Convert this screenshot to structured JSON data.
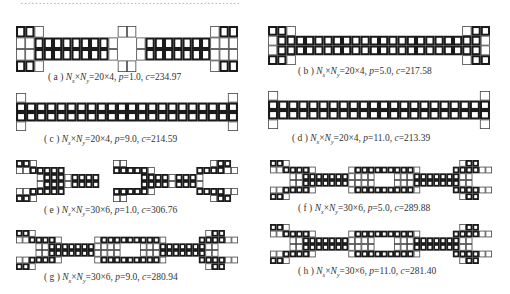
{
  "figure": {
    "top_text_fragment": "……………………………………………………",
    "panels": [
      {
        "id": "a",
        "label": "(a)",
        "nx": 20,
        "ny": 4,
        "p": "1.0",
        "c": "234.97",
        "caption_parts": {
          "open": "( a ) ",
          "nx_sym": "N",
          "nx_sub": "x",
          "times": "×",
          "ny_sym": "N",
          "ny_sub": "y",
          "eq": "=20×4, ",
          "p_sym": "p",
          "p_eq": "=1.0, ",
          "c_sym": "c",
          "c_eq": "=234.97"
        }
      },
      {
        "id": "b",
        "label": "(b)",
        "nx": 20,
        "ny": 4,
        "p": "5.0",
        "c": "217.58",
        "caption_parts": {
          "open": "( b ) ",
          "nx_sym": "N",
          "nx_sub": "x",
          "times": "×",
          "ny_sym": "N",
          "ny_sub": "y",
          "eq": "=20×4, ",
          "p_sym": "p",
          "p_eq": "=5.0, ",
          "c_sym": "c",
          "c_eq": "=217.58"
        }
      },
      {
        "id": "c",
        "label": "(c)",
        "nx": 20,
        "ny": 4,
        "p": "9.0",
        "c": "214.59",
        "caption_parts": {
          "open": "( c ) ",
          "nx_sym": "N",
          "nx_sub": "x",
          "times": "×",
          "ny_sym": "N",
          "ny_sub": "y",
          "eq": "=20×4, ",
          "p_sym": "p",
          "p_eq": "=9.0, ",
          "c_sym": "c",
          "c_eq": "=214.59"
        }
      },
      {
        "id": "d",
        "label": "(d)",
        "nx": 20,
        "ny": 4,
        "p": "11.0",
        "c": "213.39",
        "caption_parts": {
          "open": "( d ) ",
          "nx_sym": "N",
          "nx_sub": "x",
          "times": "×",
          "ny_sym": "N",
          "ny_sub": "y",
          "eq": "=20×4, ",
          "p_sym": "p",
          "p_eq": "=11.0, ",
          "c_sym": "c",
          "c_eq": "=213.39"
        }
      },
      {
        "id": "e",
        "label": "(e)",
        "nx": 30,
        "ny": 6,
        "p": "1.0",
        "c": "306.76",
        "caption_parts": {
          "open": "( e ) ",
          "nx_sym": "N",
          "nx_sub": "x",
          "times": "×",
          "ny_sym": "N",
          "ny_sub": "y",
          "eq": "=30×6, ",
          "p_sym": "p",
          "p_eq": "=1.0, ",
          "c_sym": "c",
          "c_eq": "=306.76"
        }
      },
      {
        "id": "f",
        "label": "(f)",
        "nx": 30,
        "ny": 6,
        "p": "5.0",
        "c": "289.88",
        "caption_parts": {
          "open": "( f ) ",
          "nx_sym": "N",
          "nx_sub": "x",
          "times": "×",
          "ny_sym": "N",
          "ny_sub": "y",
          "eq": "=30×6, ",
          "p_sym": "p",
          "p_eq": "=5.0, ",
          "c_sym": "c",
          "c_eq": "=289.88"
        }
      },
      {
        "id": "g",
        "label": "(g)",
        "nx": 30,
        "ny": 6,
        "p": "9.0",
        "c": "280.94",
        "caption_parts": {
          "open": "( g ) ",
          "nx_sym": "N",
          "nx_sub": "x",
          "times": "×",
          "ny_sym": "N",
          "ny_sub": "y",
          "eq": "=30×6, ",
          "p_sym": "p",
          "p_eq": "=9.0, ",
          "c_sym": "c",
          "c_eq": "=280.94"
        }
      },
      {
        "id": "h",
        "label": "(h)",
        "nx": 30,
        "ny": 6,
        "p": "11.0",
        "c": "281.40",
        "caption_parts": {
          "open": "( h ) ",
          "nx_sym": "N",
          "nx_sub": "x",
          "times": "×",
          "ny_sym": "N",
          "ny_sub": "y",
          "eq": "=30×6, ",
          "p_sym": "p",
          "p_eq": "=11.0, ",
          "c_sym": "c",
          "c_eq": "=281.40"
        }
      }
    ],
    "grids": {
      "legend": "S = solid cell (thick black frame with hole), V = void/thin cell (thin outline), . = empty",
      "a": [
        "SSV........VV........VSS",
        "VVSSSSSSSSV..VSSSSSSSVVV",
        "VVSSSSSSSSV..VSSSSSSSVVV",
        "SSV........VV........VSS"
      ],
      "b": [
        "SSV..................VSS",
        "VSSSSSSSSSSSSSSSSSSSSSSV",
        "VSSSSSSSSSSSSSSSSSSSSSSV",
        "SSV..................VSS"
      ],
      "c": [
        "V....................V",
        "SSSSSSSSSSSSSSSSSSSSSS",
        "SSSSSSSSSSSSSSSSSSSSSS",
        "V....................V"
      ],
      "d": [
        "V....................V",
        "SSSSSSSSSSSSSSSSSSSSSS",
        "SSSSSSSSSSSSSSSSSSSSSS",
        "V....................V"
      ],
      "e": [
        "SSV...........VV............VSS",
        "VVSSSSS.......SSSSSV......SSSSVV",
        "...VSSSVSSSS......SSSSVSSSV.....",
        "...VSSSVSSSS......SSSSVSSSV.....",
        "VVSSSSS.......SSSSSV......SSSSVV",
        "SSV...........VV............VSS"
      ],
      "f": [
        "SSV..........................VSS",
        "VVSSSSV.....VSSSSSSSSSV.....SSSSVV",
        "...VVSSSSSSSVVVV...VVVSSSSSSSVV...",
        "...VVSSSSSSSVVVV...VVVSSSSSSSVV...",
        "VVSSSSV.....VSSSSSSSSSV.....SSSSVV",
        "SSV..........................VSS"
      ],
      "g": [
        "SSV..........................VSS",
        "VVSSSSV.....VSSSSSSSSSV.....SSSSVV",
        "...VVSSSSSSSVVVV...VVVSSSSSSSVV...",
        "...VVSSSSSSSVVVV...VVVSSSSSSSVV...",
        "VVSSSSV.....VSSSSSSSSSV.....SSSSVV",
        "SSV..........................VSS"
      ],
      "h": [
        "SSV..........................VSS",
        "VVSSSSV.....VSSSSSSSSSV.....SSSSVV",
        "...VVSSSSSSSVVVV...VVVSSSSSSSVV...",
        "...VVSSSSSSSVVVV...VVVSSSSSSSVV...",
        "VVSSSSV.....VSSSSSSSSSV.....SSSSVV",
        "SSV..........................VSS"
      ]
    },
    "layout": {
      "a": {
        "x": 16,
        "y": 26,
        "w": 222,
        "h": 46,
        "cap_x": 48,
        "cap_y": 72
      },
      "b": {
        "x": 268,
        "y": 26,
        "w": 222,
        "h": 39,
        "cap_x": 298,
        "cap_y": 66
      },
      "c": {
        "x": 16,
        "y": 93,
        "w": 222,
        "h": 38,
        "cap_x": 44,
        "cap_y": 134
      },
      "d": {
        "x": 268,
        "y": 91,
        "w": 222,
        "h": 38,
        "cap_x": 292,
        "cap_y": 133
      },
      "e": {
        "x": 16,
        "y": 160,
        "w": 222,
        "h": 42,
        "cap_x": 44,
        "cap_y": 205
      },
      "f": {
        "x": 270,
        "y": 160,
        "w": 222,
        "h": 40,
        "cap_x": 298,
        "cap_y": 203
      },
      "g": {
        "x": 16,
        "y": 230,
        "w": 222,
        "h": 40,
        "cap_x": 44,
        "cap_y": 272
      },
      "h": {
        "x": 270,
        "y": 224,
        "w": 222,
        "h": 40,
        "cap_x": 298,
        "cap_y": 266
      }
    }
  }
}
